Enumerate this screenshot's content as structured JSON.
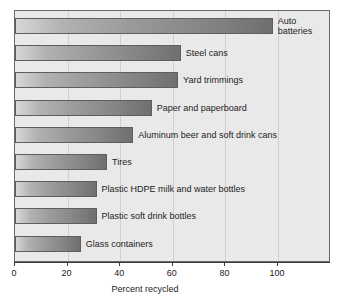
{
  "chart_data": {
    "type": "bar",
    "orientation": "horizontal",
    "title": "",
    "xlabel": "Percent recycled",
    "ylabel": "",
    "xlim": [
      0,
      120
    ],
    "xticks": [
      0,
      20,
      40,
      60,
      80,
      100
    ],
    "xtick_labels": [
      "0",
      "20",
      "40",
      "60",
      "80",
      "100"
    ],
    "grid": "vertical",
    "legend": "none",
    "categories": [
      "Auto batteries",
      "Steel cans",
      "Yard trimmings",
      "Paper and paperboard",
      "Aluminum beer and soft drink cans",
      "Tires",
      "Plastic HDPE milk and water bottles",
      "Plastic soft drink bottles",
      "Glass containers"
    ],
    "values": [
      98,
      63,
      62,
      52,
      45,
      35,
      31,
      31,
      25
    ],
    "bars": [
      {
        "label": "Auto batteries",
        "value": 98,
        "label_lines": [
          "Auto",
          "batteries"
        ]
      },
      {
        "label": "Steel cans",
        "value": 63,
        "label_lines": [
          "Steel cans"
        ]
      },
      {
        "label": "Yard trimmings",
        "value": 62,
        "label_lines": [
          "Yard trimmings"
        ]
      },
      {
        "label": "Paper and paperboard",
        "value": 52,
        "label_lines": [
          "Paper and paperboard"
        ]
      },
      {
        "label": "Aluminum beer and soft drink cans",
        "value": 45,
        "label_lines": [
          "Aluminum beer and soft drink cans"
        ]
      },
      {
        "label": "Tires",
        "value": 35,
        "label_lines": [
          "Tires"
        ]
      },
      {
        "label": "Plastic HDPE milk and water bottles",
        "value": 31,
        "label_lines": [
          "Plastic HDPE milk and water bottles"
        ]
      },
      {
        "label": "Plastic soft drink bottles",
        "value": 31,
        "label_lines": [
          "Plastic soft drink bottles"
        ]
      },
      {
        "label": "Glass containers",
        "value": 25,
        "label_lines": [
          "Glass containers"
        ]
      }
    ],
    "colors": {
      "plot_background": "#e9e9e9",
      "bar_gradient_light": "#d8d8d8",
      "bar_gradient_dark": "#6f6f6f",
      "bar_border": "#5e5e5e",
      "gridline": "#cfcfcf",
      "axis": "#3a3a3a",
      "text": "#1c1c1c",
      "page_background": "#ffffff"
    }
  }
}
